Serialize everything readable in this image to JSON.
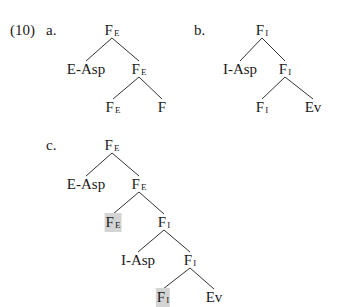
{
  "example_number": "(10)",
  "sub_labels": {
    "a": "a.",
    "b": "b.",
    "c": "c."
  },
  "highlight_color": "#d4d4d4",
  "line_color": "#333333",
  "trees": {
    "a": {
      "nodes": [
        {
          "id": "a_root",
          "base": "F",
          "sub": "E",
          "x": 112,
          "y": 23,
          "highlighted": false
        },
        {
          "id": "a_easp",
          "base": "E-Asp",
          "sub": "",
          "x": 86,
          "y": 62,
          "highlighted": false
        },
        {
          "id": "a_fe1",
          "base": "F",
          "sub": "E",
          "x": 139,
          "y": 62,
          "highlighted": false
        },
        {
          "id": "a_fe2",
          "base": "F",
          "sub": "E",
          "x": 113,
          "y": 100,
          "highlighted": false
        },
        {
          "id": "a_f",
          "base": "F",
          "sub": "",
          "x": 162,
          "y": 100,
          "highlighted": false
        }
      ],
      "edges": [
        [
          "a_root",
          "a_easp"
        ],
        [
          "a_root",
          "a_fe1"
        ],
        [
          "a_fe1",
          "a_fe2"
        ],
        [
          "a_fe1",
          "a_f"
        ]
      ]
    },
    "b": {
      "nodes": [
        {
          "id": "b_root",
          "base": "F",
          "sub": "I",
          "x": 262,
          "y": 23,
          "highlighted": false
        },
        {
          "id": "b_iasp",
          "base": "I-Asp",
          "sub": "",
          "x": 240,
          "y": 62,
          "highlighted": false
        },
        {
          "id": "b_fi1",
          "base": "F",
          "sub": "I",
          "x": 285,
          "y": 62,
          "highlighted": false
        },
        {
          "id": "b_fi2",
          "base": "F",
          "sub": "I",
          "x": 262,
          "y": 100,
          "highlighted": false
        },
        {
          "id": "b_ev",
          "base": "Ev",
          "sub": "",
          "x": 313,
          "y": 100,
          "highlighted": false
        }
      ],
      "edges": [
        [
          "b_root",
          "b_iasp"
        ],
        [
          "b_root",
          "b_fi1"
        ],
        [
          "b_fi1",
          "b_fi2"
        ],
        [
          "b_fi1",
          "b_ev"
        ]
      ]
    },
    "c": {
      "nodes": [
        {
          "id": "c_root",
          "base": "F",
          "sub": "E",
          "x": 112,
          "y": 138,
          "highlighted": false
        },
        {
          "id": "c_easp",
          "base": "E-Asp",
          "sub": "",
          "x": 86,
          "y": 177,
          "highlighted": false
        },
        {
          "id": "c_fe1",
          "base": "F",
          "sub": "E",
          "x": 139,
          "y": 177,
          "highlighted": false
        },
        {
          "id": "c_fe2",
          "base": "F",
          "sub": "E",
          "x": 113,
          "y": 215,
          "highlighted": true
        },
        {
          "id": "c_fi1",
          "base": "F",
          "sub": "I",
          "x": 164,
          "y": 215,
          "highlighted": false
        },
        {
          "id": "c_iasp",
          "base": "I-Asp",
          "sub": "",
          "x": 138,
          "y": 253,
          "highlighted": false
        },
        {
          "id": "c_fi2",
          "base": "F",
          "sub": "I",
          "x": 190,
          "y": 253,
          "highlighted": false
        },
        {
          "id": "c_fi3",
          "base": "F",
          "sub": "I",
          "x": 163,
          "y": 290,
          "highlighted": true
        },
        {
          "id": "c_ev",
          "base": "Ev",
          "sub": "",
          "x": 214,
          "y": 290,
          "highlighted": false
        }
      ],
      "edges": [
        [
          "c_root",
          "c_easp"
        ],
        [
          "c_root",
          "c_fe1"
        ],
        [
          "c_fe1",
          "c_fe2"
        ],
        [
          "c_fe1",
          "c_fi1"
        ],
        [
          "c_fi1",
          "c_iasp"
        ],
        [
          "c_fi1",
          "c_fi2"
        ],
        [
          "c_fi2",
          "c_fi3"
        ],
        [
          "c_fi2",
          "c_ev"
        ]
      ]
    }
  }
}
